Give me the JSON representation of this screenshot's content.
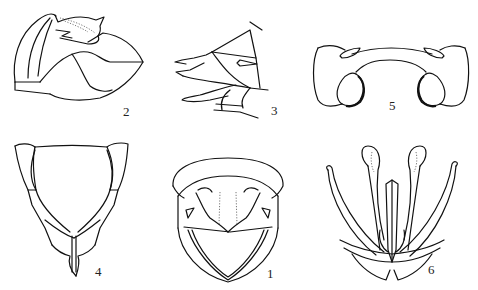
{
  "plate": {
    "background": "#ffffff",
    "line_color": "#111111",
    "figures": [
      {
        "id": "fig-2",
        "label": "2",
        "position": "top-left",
        "description": "lateral view of terminal segments"
      },
      {
        "id": "fig-3",
        "label": "3",
        "position": "top-center",
        "description": "lateral view of ovipositor/terminal appendages"
      },
      {
        "id": "fig-5",
        "label": "5",
        "position": "top-right",
        "description": "dorsal plate with paired lobes"
      },
      {
        "id": "fig-4",
        "label": "4",
        "position": "bottom-left",
        "description": "ventral view of terminal segment"
      },
      {
        "id": "fig-1",
        "label": "1",
        "position": "bottom-center",
        "description": "posterior view"
      },
      {
        "id": "fig-6",
        "label": "6",
        "position": "bottom-right",
        "description": "genital structures, ventral view"
      }
    ]
  }
}
